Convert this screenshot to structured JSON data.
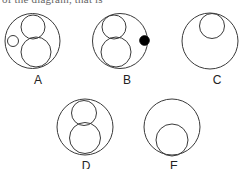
{
  "figure": {
    "partial_header_text": "of the diagram, that is",
    "stroke_color": "#3a3a3a",
    "fill_color": "#000000",
    "background_color": "#ffffff",
    "options": [
      {
        "id": "A",
        "label": "A",
        "label_x": 28,
        "label_y": 74,
        "outer": {
          "cx": 32.5,
          "cy": 41,
          "r": 27.5
        },
        "inner": [
          {
            "name": "medium-circle-top-right",
            "cx": 33,
            "cy": 27,
            "r": 12,
            "filled": false
          },
          {
            "name": "large-circle-bottom-right",
            "cx": 36,
            "cy": 52,
            "r": 15,
            "filled": false
          },
          {
            "name": "small-circle-left",
            "cx": 13,
            "cy": 41,
            "r": 5.5,
            "filled": false
          }
        ]
      },
      {
        "id": "B",
        "label": "B",
        "label_x": 117,
        "label_y": 74,
        "outer": {
          "cx": 120,
          "cy": 41,
          "r": 27.5
        },
        "inner": [
          {
            "name": "medium-circle-top-left",
            "cx": 114,
            "cy": 27,
            "r": 12,
            "filled": false
          },
          {
            "name": "large-circle-bottom-left",
            "cx": 116,
            "cy": 52,
            "r": 15,
            "filled": false
          },
          {
            "name": "filled-dot-right",
            "cx": 144.5,
            "cy": 40.5,
            "r": 4.8,
            "filled": true
          }
        ]
      },
      {
        "id": "C",
        "label": "C",
        "label_x": 207,
        "label_y": 74,
        "outer": {
          "cx": 210,
          "cy": 41,
          "r": 28
        },
        "inner": [
          {
            "name": "medium-circle-top",
            "cx": 212,
            "cy": 26,
            "r": 12.5,
            "filled": false
          }
        ]
      },
      {
        "id": "D",
        "label": "D",
        "label_x": 76,
        "label_y": 160,
        "outer": {
          "cx": 85,
          "cy": 127,
          "r": 28
        },
        "inner": [
          {
            "name": "medium-circle-top",
            "cx": 84,
            "cy": 113,
            "r": 12.5,
            "filled": false
          },
          {
            "name": "large-circle-bottom",
            "cx": 85,
            "cy": 138,
            "r": 15.5,
            "filled": false
          }
        ]
      },
      {
        "id": "E",
        "label": "E",
        "label_x": 164,
        "label_y": 160,
        "outer": {
          "cx": 172,
          "cy": 127,
          "r": 28
        },
        "inner": [
          {
            "name": "large-circle-bottom",
            "cx": 172,
            "cy": 140,
            "r": 16,
            "filled": false
          }
        ]
      }
    ]
  }
}
